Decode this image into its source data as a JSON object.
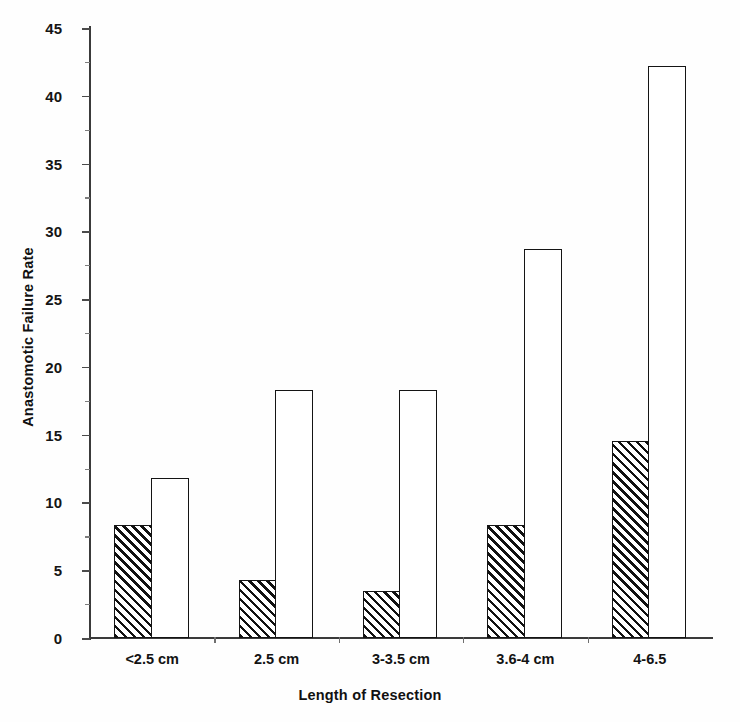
{
  "chart_data": {
    "type": "bar",
    "title": "",
    "xlabel": "Length of Resection",
    "ylabel": "Anastomotic Failure Rate",
    "categories": [
      "<2.5 cm",
      "2.5 cm",
      "3-3.5 cm",
      "3.6-4 cm",
      "4-6.5"
    ],
    "series": [
      {
        "name": "hatched",
        "values": [
          8.3,
          4.3,
          3.5,
          8.3,
          14.5
        ]
      },
      {
        "name": "open",
        "values": [
          11.8,
          18.3,
          18.3,
          28.7,
          42.2
        ]
      }
    ],
    "ylim": [
      0,
      45
    ],
    "ytick_step": 5,
    "yticks": [
      "0",
      "5",
      "10",
      "15",
      "20",
      "25",
      "30",
      "35",
      "40",
      "45"
    ],
    "grid": false,
    "legend": "none",
    "minor_ticks": true,
    "minor_tick_step": 2.5
  },
  "axes": {
    "y_title": "Anastomotic Failure Rate",
    "x_title": "Length of Resection"
  },
  "colors": {
    "axis": "#3a3a3a",
    "bar_outline": "#141414",
    "hatch": "#111111",
    "background": "#fefefe",
    "text": "#111111"
  }
}
